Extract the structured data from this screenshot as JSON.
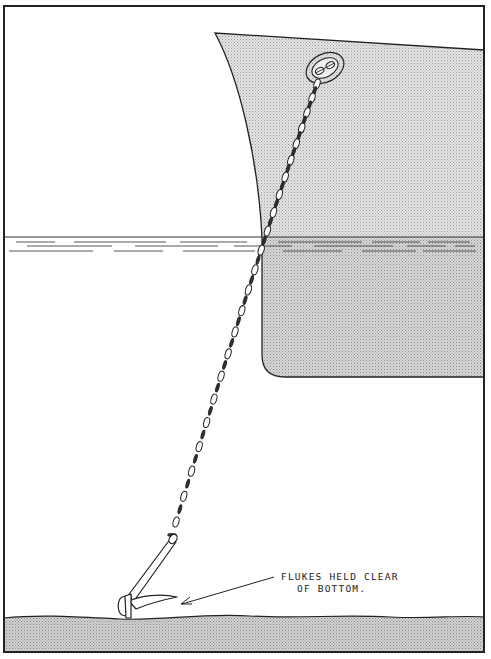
{
  "diagram": {
    "type": "technical-illustration",
    "annotation": {
      "line1": "FLUKES HELD CLEAR",
      "line2": "OF BOTTOM."
    },
    "elements": [
      "frame",
      "ship-hull",
      "hawsepipe",
      "waterline",
      "water-surface-lines",
      "anchor-chain",
      "anchor",
      "sea-bottom",
      "annotation-arrow"
    ],
    "colors": {
      "ink": "#222222",
      "background": "#ffffff",
      "shading": "#d6d6d6"
    }
  }
}
